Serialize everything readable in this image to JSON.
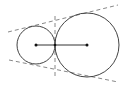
{
  "diagram": {
    "colors": {
      "stroke": "#444444",
      "dashed": "#888888",
      "background": "#ffffff"
    },
    "small_circle": {
      "cx": 36,
      "cy": 45,
      "r": 19
    },
    "large_circle": {
      "cx": 87,
      "cy": 45,
      "r": 32
    },
    "center_segment": {
      "x1": 36,
      "y1": 45,
      "x2": 87,
      "y2": 45
    },
    "upper_tangent": {
      "x1": 8,
      "y1": 32,
      "x2": 118,
      "y2": 5
    },
    "lower_tangent": {
      "x1": 9,
      "y1": 60,
      "x2": 118,
      "y2": 82
    },
    "internal_tangent": {
      "x1": 55,
      "y1": 16,
      "x2": 55,
      "y2": 76
    }
  }
}
